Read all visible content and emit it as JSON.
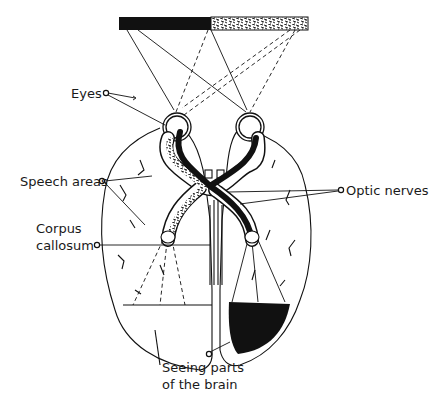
{
  "diagram": {
    "visual_field_bar": {
      "left_half": "solid black",
      "right_half": "speckled"
    },
    "labels": {
      "eyes": "Eyes",
      "speech_areas": "Speech areas",
      "corpus_callosum_1": "Corpus",
      "corpus_callosum_2": "callosum",
      "optic_nerves": "Optic nerves",
      "seeing_parts_1": "Seeing parts",
      "seeing_parts_2": "of the brain"
    },
    "colors": {
      "ink": "#111111",
      "background": "#ffffff"
    }
  }
}
